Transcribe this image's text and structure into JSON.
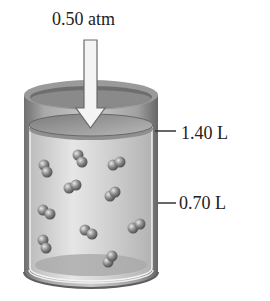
{
  "figure": {
    "type": "piston-cylinder diagram",
    "pressure_label": "0.50 atm",
    "volume_marks": [
      {
        "label": "1.40 L",
        "position": "piston level"
      },
      {
        "label": "0.70 L",
        "position": "half level"
      }
    ],
    "molecule_count": 14,
    "molecule_type": "diatomic",
    "colors": {
      "cylinder": "#8a8a8a",
      "gas_fill": "#d6d6d6",
      "piston": "#9a9a9a",
      "arrow_fill": "#f2f2f2",
      "molecule": "#7d7d7d",
      "text": "#222222"
    }
  }
}
